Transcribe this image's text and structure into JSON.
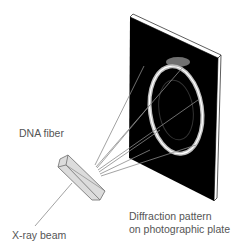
{
  "labels": {
    "dna_fiber": "DNA fiber",
    "xray_beam": "X-ray beam",
    "diffraction_line1": "Diffraction pattern",
    "diffraction_line2": "on photographic plate"
  },
  "colors": {
    "plate": "#000000",
    "plate_edge": "#ffffff",
    "rays": "#8a8a8a",
    "crystal_fill": "#dcdcdc",
    "crystal_stroke": "#7a7a7a",
    "text": "#555555"
  }
}
